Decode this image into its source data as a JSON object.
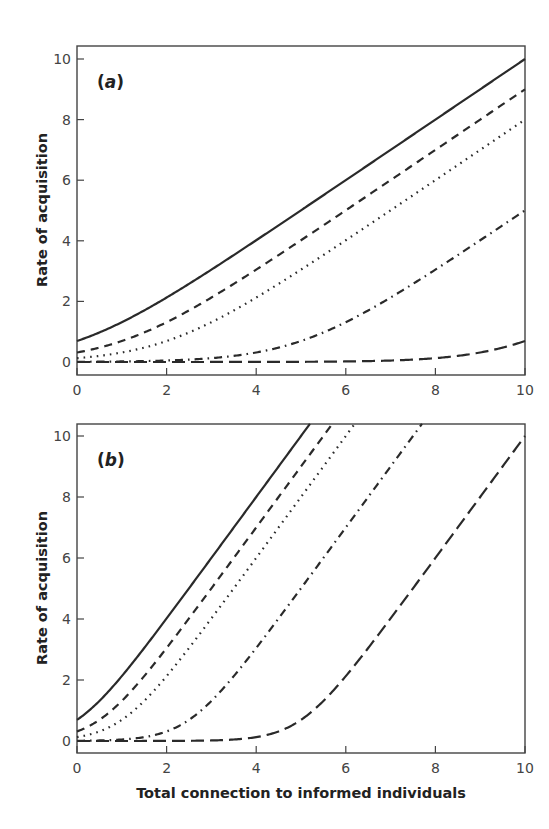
{
  "chart_data": [
    {
      "type": "line",
      "panel": "a",
      "panel_label": "(a)",
      "panel_letter": "a",
      "xlabel": "",
      "ylabel": "Rate of acquisition",
      "xlim": [
        0,
        10
      ],
      "ylim": [
        -0.4,
        10.4
      ],
      "xticks": [
        0,
        2,
        4,
        6,
        8,
        10
      ],
      "yticks": [
        0,
        2,
        4,
        6,
        8,
        10
      ],
      "grid": false,
      "legend": null,
      "x": [
        0,
        1,
        2,
        3,
        4,
        5,
        6,
        7,
        8,
        9,
        10
      ],
      "series": [
        {
          "name": "solid",
          "style": "solid",
          "slope": 1,
          "offset": 0,
          "values": [
            0.69,
            1.31,
            2.13,
            3.05,
            4.02,
            5.01,
            6.0,
            7.0,
            8.0,
            9.0,
            10.0
          ]
        },
        {
          "name": "short-dash",
          "style": "dashed",
          "slope": 1,
          "offset": 1,
          "values": [
            0.31,
            0.69,
            1.31,
            2.13,
            3.05,
            4.02,
            5.01,
            6.0,
            7.0,
            8.0,
            9.0
          ]
        },
        {
          "name": "dotted",
          "style": "dotted",
          "slope": 1,
          "offset": 2,
          "values": [
            0.13,
            0.31,
            0.69,
            1.31,
            2.13,
            3.05,
            4.02,
            5.01,
            6.0,
            7.0,
            8.0
          ]
        },
        {
          "name": "dash-dot",
          "style": "dashdot",
          "slope": 1,
          "offset": 5,
          "values": [
            0.01,
            0.02,
            0.05,
            0.13,
            0.31,
            0.69,
            1.31,
            2.13,
            3.05,
            4.02,
            5.01
          ]
        },
        {
          "name": "long-dash",
          "style": "longdash",
          "slope": 1,
          "offset": 10,
          "values": [
            0.0,
            0.0,
            0.0,
            0.0,
            0.0,
            0.01,
            0.02,
            0.05,
            0.13,
            0.31,
            0.69
          ]
        }
      ]
    },
    {
      "type": "line",
      "panel": "b",
      "panel_label": "(b)",
      "panel_letter": "b",
      "xlabel": "Total connection to informed individuals",
      "ylabel": "Rate of acquisition",
      "xlim": [
        0,
        10
      ],
      "ylim": [
        -0.4,
        10.4
      ],
      "xticks": [
        0,
        2,
        4,
        6,
        8,
        10
      ],
      "yticks": [
        0,
        2,
        4,
        6,
        8,
        10
      ],
      "grid": false,
      "legend": null,
      "x": [
        0,
        1,
        2,
        3,
        4,
        5,
        6,
        7,
        8,
        9,
        10
      ],
      "series": [
        {
          "name": "solid",
          "style": "solid",
          "slope": 2,
          "offset": 0,
          "values": [
            0.69,
            2.13,
            4.02,
            6.0,
            8.0,
            10.0,
            null,
            null,
            null,
            null,
            null
          ]
        },
        {
          "name": "short-dash",
          "style": "dashed",
          "slope": 2,
          "offset": 1,
          "values": [
            0.31,
            1.31,
            3.05,
            5.01,
            7.0,
            9.0,
            null,
            null,
            null,
            null,
            null
          ]
        },
        {
          "name": "dotted",
          "style": "dotted",
          "slope": 2,
          "offset": 2,
          "values": [
            0.13,
            0.69,
            2.13,
            4.02,
            6.0,
            8.0,
            10.0,
            null,
            null,
            null,
            null
          ]
        },
        {
          "name": "dash-dot",
          "style": "dashdot",
          "slope": 2,
          "offset": 5,
          "values": [
            0.01,
            0.05,
            0.31,
            1.31,
            3.05,
            5.01,
            7.0,
            9.0,
            null,
            null,
            null
          ]
        },
        {
          "name": "long-dash",
          "style": "longdash",
          "slope": 2,
          "offset": 10,
          "values": [
            0.0,
            0.0,
            0.0,
            0.02,
            0.13,
            0.69,
            2.13,
            4.02,
            6.0,
            8.0,
            10.0
          ]
        }
      ]
    }
  ]
}
